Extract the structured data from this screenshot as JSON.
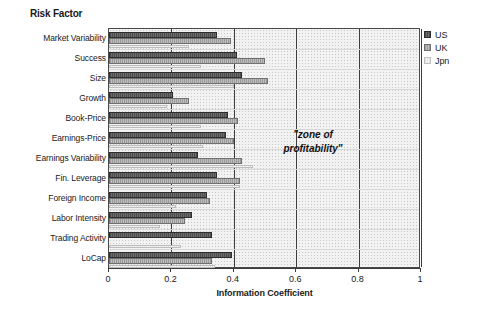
{
  "chart_data": {
    "type": "bar",
    "orientation": "horizontal",
    "title": "Risk Factor",
    "xlabel": "Information Coefficient",
    "ylabel": "",
    "xlim": [
      0,
      1
    ],
    "ylim": null,
    "grid": true,
    "xticks": [
      "0",
      "0.2",
      "0.4",
      "0.6",
      "0.8",
      "1"
    ],
    "xtick_values": [
      0,
      0.2,
      0.4,
      0.6,
      0.8,
      1
    ],
    "legend_position": "right",
    "categories": [
      "Market Variability",
      "Success",
      "Size",
      "Growth",
      "Book-Price",
      "Earnings-Price",
      "Earnings Variability",
      "Fin. Leverage",
      "Foreign Income",
      "Labor Intensity",
      "Trading Activity",
      "LoCap"
    ],
    "series": [
      {
        "name": "US",
        "color": "#595959",
        "values": [
          0.345,
          0.41,
          0.425,
          0.205,
          0.38,
          0.375,
          0.285,
          0.345,
          0.315,
          0.265,
          0.33,
          0.395
        ]
      },
      {
        "name": "UK",
        "color": "#a8a8a8",
        "values": [
          0.39,
          0.5,
          0.51,
          0.255,
          0.415,
          0.4,
          0.425,
          0.42,
          0.325,
          0.245,
          0.0,
          0.33
        ]
      },
      {
        "name": "Jpn",
        "color": "#efefef",
        "values": [
          0.255,
          0.295,
          0.4,
          0.185,
          0.295,
          0.3,
          0.46,
          0.42,
          0.215,
          0.165,
          0.23,
          0.34
        ]
      }
    ],
    "annotations": [
      {
        "text_line1": "\"zone of",
        "text_line2": "profitability\"",
        "x": 0.66,
        "y_index": 6
      }
    ]
  },
  "legend": {
    "items": [
      {
        "label": "US",
        "swatch": "us-swatch-icon"
      },
      {
        "label": "UK",
        "swatch": "uk-swatch-icon"
      },
      {
        "label": "Jpn",
        "swatch": "jpn-swatch-icon"
      }
    ]
  }
}
